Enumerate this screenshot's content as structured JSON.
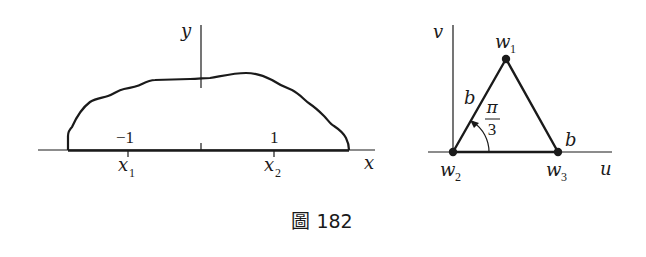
{
  "caption": "圖 182",
  "left_figure": {
    "axis_x_label": "x",
    "axis_y_label": "y",
    "tick_labels": [
      "−1",
      "1"
    ],
    "point_labels": [
      {
        "name": "x",
        "sub": "1"
      },
      {
        "name": "x",
        "sub": "2"
      }
    ]
  },
  "right_figure": {
    "axis_u_label": "u",
    "axis_v_label": "v",
    "vertices": [
      {
        "name": "w",
        "sub": "1"
      },
      {
        "name": "w",
        "sub": "2"
      },
      {
        "name": "w",
        "sub": "3"
      }
    ],
    "side_labels": [
      "b",
      "b"
    ],
    "angle_label_num": "π",
    "angle_label_den": "3"
  },
  "colors": {
    "ink": "#1a1a1a",
    "background": "#ffffff"
  }
}
